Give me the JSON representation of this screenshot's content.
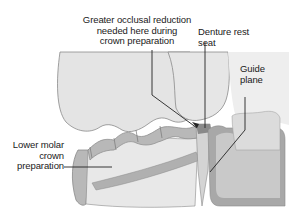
{
  "diagram": {
    "labels": {
      "occlusal_reduction": "Greater occlusal reduction\nneeded here during\ncrown preparation",
      "rest_seat": "Denture rest\nseat",
      "guide_plane": "Guide\nplane",
      "lower_molar": "Lower molar\ncrown\npreparation"
    },
    "colors": {
      "upper_tooth": "#e4e4e4",
      "tooth_outline": "#8a8a8a",
      "crown_body": "#e8e8e8",
      "crown_band": "#b8b8b8",
      "denture_base": "#c9c9c9",
      "denture_dark": "#a8a8a8",
      "leader": "#222222"
    }
  }
}
